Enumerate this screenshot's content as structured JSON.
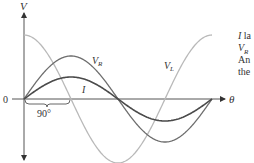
{
  "diagram": {
    "axes": {
      "y_label": "V",
      "x_label": "θ",
      "origin_label": "0"
    },
    "phase_marker": "90°",
    "curves": [
      {
        "name": "V_L",
        "label": "V",
        "subscript": "L",
        "color": "#b9b9b9",
        "amplitude": 64,
        "phase_deg": 90
      },
      {
        "name": "V_R",
        "label": "V",
        "subscript": "R",
        "color": "#6e6e6e",
        "amplitude": 43,
        "phase_deg": 0
      },
      {
        "name": "I",
        "label": "I",
        "subscript": "",
        "color": "#4a4a4a",
        "amplitude": 22,
        "phase_deg": 0
      }
    ],
    "side_text": [
      {
        "lead": "I",
        "rest": " la"
      },
      {
        "lead": "V",
        "sub": "R",
        "rest": ""
      },
      {
        "lead": "",
        "rest": "An"
      },
      {
        "lead": "",
        "rest": "the"
      }
    ]
  }
}
